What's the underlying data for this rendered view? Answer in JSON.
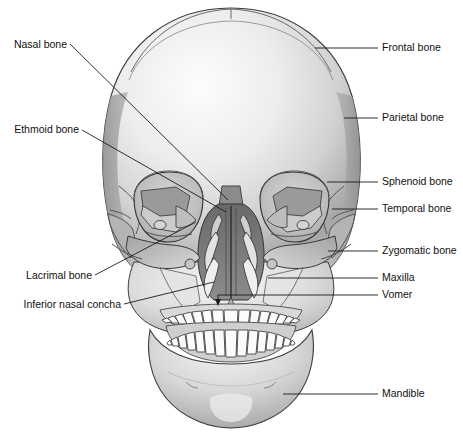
{
  "figure": {
    "background_color": "#ffffff",
    "line_color": "#1a1a1a",
    "bone_fill_light": "#f2f2f2",
    "bone_fill_mid": "#c8c8c8",
    "bone_fill_dark": "#8e8e8e",
    "cavity_fill": "#6f6f6f",
    "tooth_fill": "#fbfbfb"
  },
  "labels_left": [
    {
      "id": "nasal-bone",
      "text": "Nasal bone",
      "x": 8,
      "y": 48
    },
    {
      "id": "ethmoid-bone",
      "text": "Ethmoid bone",
      "x": 8,
      "y": 133
    },
    {
      "id": "lacrimal-bone",
      "text": "Lacrimal bone",
      "x": 11,
      "y": 279
    },
    {
      "id": "inferior-nasal-concha",
      "text": "Inferior nasal concha",
      "x": 8,
      "y": 308
    }
  ],
  "labels_right": [
    {
      "id": "frontal-bone",
      "text": "Frontal bone",
      "x": 382,
      "y": 51
    },
    {
      "id": "parietal-bone",
      "text": "Parietal bone",
      "x": 382,
      "y": 121
    },
    {
      "id": "sphenoid-bone",
      "text": "Sphenoid bone",
      "x": 382,
      "y": 185
    },
    {
      "id": "temporal-bone",
      "text": "Temporal bone",
      "x": 382,
      "y": 212
    },
    {
      "id": "zygomatic-bone",
      "text": "Zygomatic bone",
      "x": 382,
      "y": 254
    },
    {
      "id": "maxilla",
      "text": "Maxilla",
      "x": 382,
      "y": 281
    },
    {
      "id": "vomer",
      "text": "Vomer",
      "x": 382,
      "y": 298
    },
    {
      "id": "mandible",
      "text": "Mandible",
      "x": 382,
      "y": 397
    }
  ]
}
